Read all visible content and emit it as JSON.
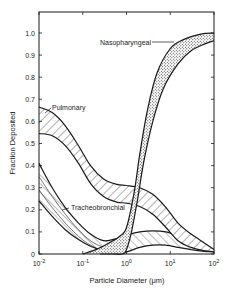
{
  "chart_data": {
    "type": "area",
    "title": "",
    "xlabel": "Particle Diameter (μm)",
    "ylabel": "Fraction Deposited",
    "xscale": "log",
    "xlim": [
      0.01,
      100
    ],
    "ylim": [
      0,
      1.08
    ],
    "x_ticks": [
      0.01,
      0.1,
      1,
      10,
      100
    ],
    "x_tick_labels": [
      {
        "base": "10",
        "exp": "-2"
      },
      {
        "base": "10",
        "exp": "-1"
      },
      {
        "base": "10",
        "exp": "0"
      },
      {
        "base": "10",
        "exp": "1"
      },
      {
        "base": "10",
        "exp": "2"
      }
    ],
    "y_ticks": [
      0,
      0.1,
      0.2,
      0.3,
      0.4,
      0.5,
      0.6,
      0.7,
      0.8,
      0.9,
      1.0
    ],
    "y_tick_labels": [
      "0",
      "0.1",
      "0.2",
      "0.3",
      "0.4",
      "0.5",
      "0.6",
      "0.7",
      "0.8",
      "0.9",
      "1.0"
    ],
    "grid": false,
    "series": [
      {
        "name": "Nasopharyngeal",
        "fill": "stipple",
        "upper": {
          "x": [
            0.1,
            0.2,
            0.4,
            0.7,
            1.0,
            1.5,
            2,
            3,
            5,
            10,
            20,
            50,
            100
          ],
          "y": [
            0.0,
            0.02,
            0.05,
            0.08,
            0.12,
            0.28,
            0.45,
            0.65,
            0.82,
            0.93,
            0.97,
            0.995,
            1.0
          ]
        },
        "lower": {
          "x": [
            0.25,
            0.5,
            0.8,
            1.0,
            1.3,
            1.8,
            2.5,
            4,
            7,
            15,
            30,
            60,
            100
          ],
          "y": [
            0.0,
            0.0,
            0.0,
            0.02,
            0.1,
            0.25,
            0.42,
            0.6,
            0.75,
            0.86,
            0.92,
            0.95,
            0.965
          ]
        }
      },
      {
        "name": "Pulmonary",
        "fill": "hatch",
        "upper": {
          "x": [
            0.01,
            0.02,
            0.04,
            0.08,
            0.15,
            0.3,
            0.6,
            1.0,
            2,
            4,
            8,
            15,
            30,
            60,
            100
          ],
          "y": [
            0.665,
            0.64,
            0.58,
            0.49,
            0.4,
            0.34,
            0.315,
            0.31,
            0.3,
            0.27,
            0.21,
            0.14,
            0.09,
            0.05,
            0.02
          ]
        },
        "lower": {
          "x": [
            0.01,
            0.02,
            0.04,
            0.08,
            0.15,
            0.3,
            0.6,
            1.0,
            2,
            4,
            8,
            15,
            30,
            60,
            100
          ],
          "y": [
            0.545,
            0.535,
            0.49,
            0.41,
            0.32,
            0.26,
            0.235,
            0.23,
            0.215,
            0.18,
            0.12,
            0.06,
            0.03,
            0.015,
            0.01
          ]
        }
      },
      {
        "name": "Tracheobronchial",
        "fill": "hatch-light",
        "upper": {
          "x": [
            0.01,
            0.02,
            0.04,
            0.08,
            0.15,
            0.3,
            0.6,
            1.0,
            2,
            4,
            8,
            15,
            30,
            60,
            100
          ],
          "y": [
            0.41,
            0.3,
            0.21,
            0.14,
            0.09,
            0.06,
            0.07,
            0.085,
            0.1,
            0.105,
            0.1,
            0.08,
            0.05,
            0.025,
            0.015
          ]
        },
        "middle": {
          "x": [
            0.01,
            0.02,
            0.04,
            0.08,
            0.15,
            0.3,
            0.6
          ],
          "y": [
            0.35,
            0.26,
            0.18,
            0.11,
            0.06,
            0.03,
            0.02
          ]
        },
        "middle2": {
          "x": [
            0.01,
            0.02,
            0.04,
            0.08,
            0.15,
            0.3,
            0.6
          ],
          "y": [
            0.29,
            0.21,
            0.14,
            0.08,
            0.04,
            0.015,
            0.01
          ]
        },
        "lower": {
          "x": [
            0.01,
            0.02,
            0.04,
            0.08,
            0.15,
            0.3,
            0.6,
            1.0,
            2,
            4,
            8,
            15,
            30,
            60,
            100
          ],
          "y": [
            0.24,
            0.17,
            0.11,
            0.065,
            0.035,
            0.015,
            0.01,
            0.01,
            0.03,
            0.04,
            0.04,
            0.03,
            0.02,
            0.012,
            0.01
          ]
        }
      }
    ],
    "annotations": [
      {
        "text": "Nasopharyngeal",
        "target_series": "Nasopharyngeal",
        "arrow": true
      },
      {
        "text": "Pulmonary",
        "target_series": "Pulmonary",
        "arrow": true
      },
      {
        "text": "Tracheobronchial",
        "target_series": "Tracheobronchial",
        "arrow": true
      }
    ]
  }
}
